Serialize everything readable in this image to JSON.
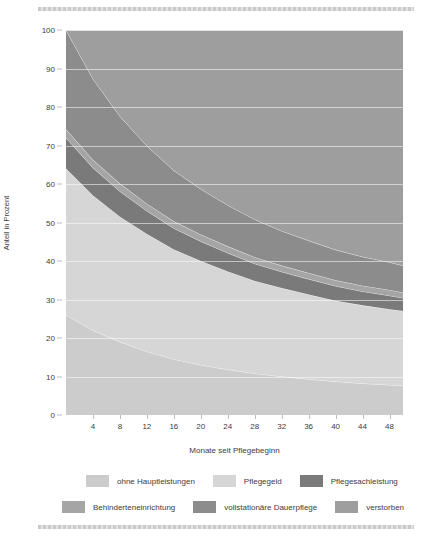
{
  "chart_data": {
    "type": "area",
    "stacked": true,
    "title": "",
    "xlabel": "Monate seit Pflegebeginn",
    "ylabel": "Anteil in Prozent",
    "xlim": [
      0,
      50
    ],
    "ylim": [
      0,
      100
    ],
    "xticks": [
      4,
      8,
      12,
      16,
      20,
      24,
      28,
      32,
      36,
      40,
      44,
      48
    ],
    "yticks": [
      0,
      10,
      20,
      30,
      40,
      50,
      60,
      70,
      80,
      90,
      100
    ],
    "grid": true,
    "legend_position": "bottom",
    "x": [
      0,
      4,
      8,
      12,
      16,
      20,
      24,
      28,
      32,
      36,
      40,
      44,
      48,
      50
    ],
    "series": [
      {
        "name": "ohne Hauptleistungen",
        "color": "#cccccc",
        "values": [
          26.0,
          22.0,
          19.0,
          16.5,
          14.5,
          13.0,
          11.8,
          10.8,
          10.0,
          9.3,
          8.7,
          8.2,
          7.8,
          7.6
        ]
      },
      {
        "name": "Pflegegeld",
        "color": "#d6d6d6",
        "values": [
          38.0,
          35.0,
          32.5,
          30.5,
          28.5,
          27.0,
          25.5,
          24.0,
          23.0,
          22.0,
          21.0,
          20.3,
          19.7,
          19.4
        ]
      },
      {
        "name": "Pflegesachleistung",
        "color": "#7a7a7a",
        "values": [
          8.0,
          7.2,
          6.6,
          6.0,
          5.5,
          5.1,
          4.8,
          4.5,
          4.2,
          4.0,
          3.8,
          3.6,
          3.5,
          3.4
        ]
      },
      {
        "name": "Behinderteneinrichtung",
        "color": "#a5a5a5",
        "values": [
          2.2,
          2.1,
          2.0,
          1.9,
          1.8,
          1.8,
          1.7,
          1.7,
          1.6,
          1.6,
          1.5,
          1.5,
          1.5,
          1.4
        ]
      },
      {
        "name": "vollstationäre Dauerpflege",
        "color": "#8c8c8c",
        "values": [
          25.8,
          21.0,
          17.5,
          15.0,
          13.2,
          11.8,
          10.7,
          9.8,
          9.0,
          8.4,
          7.9,
          7.5,
          7.2,
          7.0
        ]
      },
      {
        "name": "verstorben",
        "color": "#9e9e9e",
        "values": [
          0.0,
          12.7,
          22.4,
          30.1,
          36.5,
          41.3,
          45.5,
          49.2,
          52.2,
          54.7,
          57.1,
          58.9,
          60.3,
          61.2
        ]
      }
    ]
  },
  "axes": {
    "ylabel": "Anteil in Prozent",
    "xlabel": "Monate seit Pflegebeginn",
    "yticks": [
      "0",
      "10",
      "20",
      "30",
      "40",
      "50",
      "60",
      "70",
      "80",
      "90",
      "100"
    ],
    "xticks": [
      "4",
      "8",
      "12",
      "16",
      "20",
      "24",
      "28",
      "32",
      "36",
      "40",
      "44",
      "48"
    ]
  },
  "legend": {
    "row1": [
      {
        "label": "ohne Hauptleistungen",
        "color": "#cccccc"
      },
      {
        "label": "Pflegegeld",
        "color": "#d6d6d6"
      },
      {
        "label": "Pflegesachleistung",
        "color": "#7a7a7a"
      }
    ],
    "row2": [
      {
        "label": "Behinderteneinrichtung",
        "color": "#a5a5a5"
      },
      {
        "label": "vollstationäre Dauerpflege",
        "color": "#8c8c8c"
      },
      {
        "label": "verstorben",
        "color": "#9e9e9e"
      }
    ]
  }
}
